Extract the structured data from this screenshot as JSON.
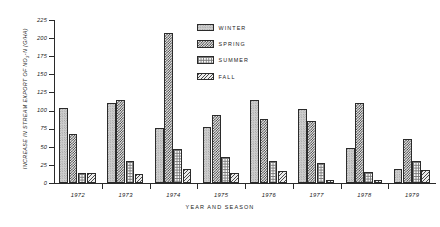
{
  "chart_data": {
    "type": "bar",
    "title": "",
    "xlabel": "YEAR AND SEASON",
    "ylabel": "INCREASE IN STREAM EXPORT OF NO3-N (G/HA)",
    "ylabel_main": "INCREASE IN STREAM EXPORT OF NO",
    "ylabel_sub": "3",
    "ylabel_tail": "-N (G/HA)",
    "ylim": [
      0,
      225
    ],
    "yticks": [
      0,
      25,
      50,
      75,
      100,
      125,
      150,
      175,
      200,
      225
    ],
    "ytick_labels": [
      "0",
      "25",
      "50",
      "75",
      "100",
      "125",
      "150",
      "175",
      "200",
      "225"
    ],
    "grid": false,
    "legend_position": "upper-center",
    "categories": [
      "1972",
      "1973",
      "1974",
      "1975",
      "1976",
      "1977",
      "1978",
      "1979"
    ],
    "series": [
      {
        "name": "WINTER",
        "pattern": "light-stipple",
        "values": [
          104,
          111,
          76,
          77,
          115,
          102,
          48,
          20
        ]
      },
      {
        "name": "SPRING",
        "pattern": "dark-checker",
        "values": [
          67,
          115,
          207,
          94,
          88,
          86,
          111,
          61
        ]
      },
      {
        "name": "SUMMER",
        "pattern": "light-grid",
        "values": [
          14,
          31,
          47,
          36,
          30,
          27,
          15,
          31
        ]
      },
      {
        "name": "FALL",
        "pattern": "diagonal-hatch",
        "values": [
          14,
          12,
          19,
          14,
          16,
          4,
          4,
          18
        ]
      }
    ]
  },
  "legend": {
    "items": [
      {
        "label": "WINTER"
      },
      {
        "label": "SPRING"
      },
      {
        "label": "SUMMER"
      },
      {
        "label": "FALL"
      }
    ]
  }
}
